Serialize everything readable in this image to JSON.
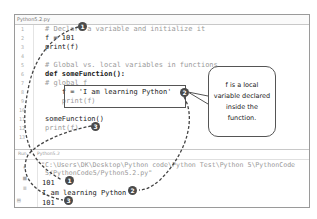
{
  "editor": {
    "tab_label": "Python5.2.py",
    "line_numbers": [
      "1",
      "2",
      "3",
      "4",
      "5",
      "6",
      "7",
      "8",
      "9",
      "10",
      "11",
      "12",
      "13"
    ],
    "lines": [
      "# Declare a variable and initialize it",
      "f = 101",
      "print(f)",
      "",
      "# Global vs. local variables in functions",
      "def someFunction():",
      "# global f",
      "    f = 'I am learning Python'",
      "    print(f)",
      "",
      "someFunction()",
      "print(f)",
      ""
    ]
  },
  "console": {
    "tabs": [
      "Run",
      "Python5.2"
    ],
    "command_line_1": "\"C:\\Users\\DK\\Desktop\\Python code\\Python Test\\Python 5\\PythonCode",
    "command_line_2": "5/PythonCode5/Python5.2.py\"",
    "output": [
      "101",
      "I am learning Python",
      "101"
    ]
  },
  "annotations": {
    "badges": [
      "1",
      "2",
      "3"
    ],
    "callout_lines": [
      "f is a local",
      "variable declared",
      "inside the",
      "function."
    ]
  }
}
